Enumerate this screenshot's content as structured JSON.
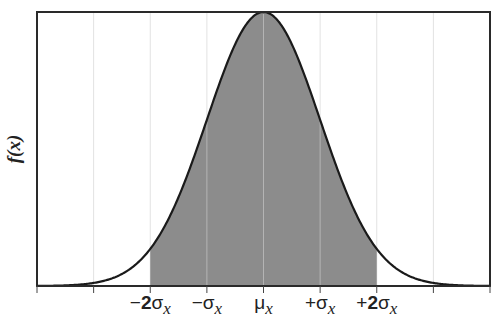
{
  "chart_data": {
    "type": "area",
    "title": "",
    "subtitle": "",
    "xlabel": "",
    "ylabel": "f(x)",
    "distribution": "normal",
    "x_range_sigma": [
      -4,
      4
    ],
    "tick_positions_sigma": [
      -4,
      -3,
      -2,
      -1,
      0,
      1,
      2,
      3,
      4
    ],
    "tick_labels": [
      {
        "pos": -2,
        "sign": "−",
        "num": "2",
        "sym": "σ",
        "sub": "x"
      },
      {
        "pos": -1,
        "sign": "−",
        "num": "",
        "sym": "σ",
        "sub": "x"
      },
      {
        "pos": 0,
        "sign": "",
        "num": "",
        "sym": "μ",
        "sub": "x"
      },
      {
        "pos": 1,
        "sign": "+",
        "num": "",
        "sym": "σ",
        "sub": "x"
      },
      {
        "pos": 2,
        "sign": "+",
        "num": "2",
        "sym": "σ",
        "sub": "x"
      }
    ],
    "shaded_region_sigma": [
      -2,
      2
    ],
    "shaded_label": "μ ± 2σ (≈95.4%)",
    "grid": {
      "vertical": true,
      "horizontal": false
    },
    "legend": null,
    "y_ticks": [],
    "colors": {
      "curve": "#1a1a1a",
      "shade": "#8c8c8c",
      "grid_on_white": "#e2e2e2",
      "grid_on_shade": "#b4b4b4",
      "frame": "#2a2a2a"
    }
  }
}
